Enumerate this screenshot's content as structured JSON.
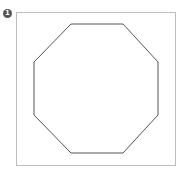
{
  "figure": {
    "badge_number": "1",
    "shape": "octagon",
    "stroke_color": "#555555",
    "frame_color": "#bdbdbd",
    "points": "71,24 123,24 158,62 158,115 123,153 71,153 34,115 34,62"
  }
}
